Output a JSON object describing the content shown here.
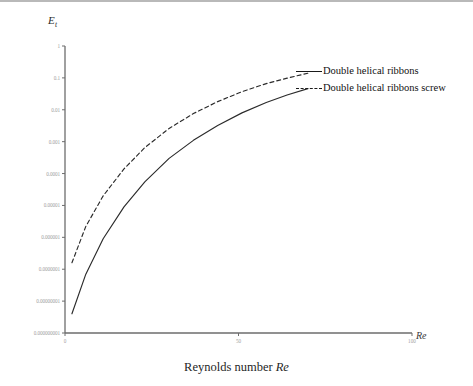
{
  "chart_data": {
    "type": "line",
    "title": "",
    "xlabel": "Reynolds number Re",
    "ylabel": "E",
    "ylabel_sub": "t",
    "xaxis_title": "Re",
    "yscale": "log",
    "xlim": [
      0,
      100
    ],
    "ylim": [
      1e-09,
      1
    ],
    "grid": false,
    "legend_position": "top-right",
    "xticks": [
      0,
      50,
      100
    ],
    "xtick_labels": [
      "0",
      "50",
      "100"
    ],
    "yticks": [
      1,
      0.1,
      0.01,
      0.001,
      0.0001,
      1e-05,
      1e-06,
      1e-07,
      1e-08,
      1e-09
    ],
    "ytick_labels": [
      "1",
      "0.1",
      "0.01",
      "0.001",
      "0.0001",
      "0.00001",
      "0.000001",
      "0.0000001",
      "0.00000001",
      "0.000000001"
    ],
    "series": [
      {
        "name": "Double helical ribbons",
        "style": "solid",
        "color": "#2b2b2b",
        "x": [
          2,
          6,
          11,
          17,
          23,
          30,
          37,
          44,
          51,
          58,
          64,
          70
        ],
        "y": [
          4e-09,
          7e-08,
          9e-07,
          9e-06,
          5.5e-05,
          0.0003,
          0.0011,
          0.0032,
          0.008,
          0.017,
          0.029,
          0.046
        ]
      },
      {
        "name": "Double helical ribbons screw",
        "style": "dashed",
        "color": "#2b2b2b",
        "x": [
          2,
          6,
          11,
          17,
          23,
          30,
          37,
          44,
          51,
          58,
          64,
          70
        ],
        "y": [
          1.6e-07,
          2.2e-06,
          2e-05,
          0.00014,
          0.00065,
          0.0026,
          0.0076,
          0.018,
          0.037,
          0.066,
          0.098,
          0.14
        ]
      }
    ]
  },
  "legend": {
    "items": [
      {
        "label": "Double helical ribbons",
        "style": "solid"
      },
      {
        "label": "Double helical ribbons screw",
        "style": "dashed"
      }
    ]
  },
  "axes": {
    "y_title_main": "E",
    "y_title_sub": "t",
    "x_title": "Re",
    "x_caption_prefix": "Reynolds number ",
    "x_caption_symbol": "Re"
  }
}
